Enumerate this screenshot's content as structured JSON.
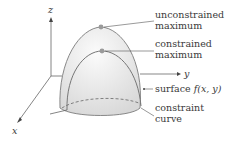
{
  "axes": {
    "z": "z",
    "y": "y",
    "x": "x"
  },
  "labels": {
    "unconstrained": [
      "unconstrained",
      "maximum"
    ],
    "constrained": [
      "constrained",
      "maximum"
    ],
    "surface_prefix": "surface ",
    "surface_func": "f(x, y)",
    "constraint": [
      "constraint",
      "curve"
    ]
  },
  "colors": {
    "line": "#7a7a7a",
    "dome_fill": "#e6e6e6",
    "point": "#9a9a9a",
    "text": "#3a3a3a"
  }
}
